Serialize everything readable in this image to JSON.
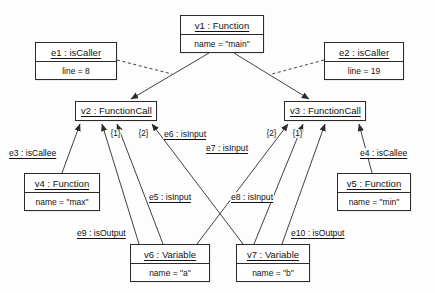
{
  "diagram": {
    "stroke_color": "#2b2b2b",
    "background_color": "#fdfdfd"
  },
  "nodes": [
    {
      "id": "v1",
      "title": "v1 : Function",
      "attr": "name = \"main\"",
      "x": 180,
      "y": 15,
      "w": 84,
      "h": 38
    },
    {
      "id": "e1",
      "title": "e1 : isCaller",
      "attr": "line = 8",
      "x": 35,
      "y": 42,
      "w": 82,
      "h": 38
    },
    {
      "id": "e2",
      "title": "e2 : isCaller",
      "attr": "line = 19",
      "x": 324,
      "y": 42,
      "w": 80,
      "h": 38
    },
    {
      "id": "v2",
      "title": "v2 : FunctionCall",
      "attr": "",
      "x": 75,
      "y": 101,
      "w": 82,
      "h": 20
    },
    {
      "id": "v3",
      "title": "v3 : FunctionCall",
      "attr": "",
      "x": 284,
      "y": 101,
      "w": 82,
      "h": 20
    },
    {
      "id": "v4",
      "title": "v4 : Function",
      "attr": "name = \"max\"",
      "x": 24,
      "y": 173,
      "w": 76,
      "h": 38
    },
    {
      "id": "v5",
      "title": "v5 : Function",
      "attr": "name = \"min\"",
      "x": 337,
      "y": 173,
      "w": 74,
      "h": 38
    },
    {
      "id": "v6",
      "title": "v6 : Variable",
      "attr": "name = \"a\"",
      "x": 130,
      "y": 244,
      "w": 80,
      "h": 38
    },
    {
      "id": "v7",
      "title": "v7 : Variable",
      "attr": "name = \"b\"",
      "x": 236,
      "y": 244,
      "w": 74,
      "h": 38
    }
  ],
  "edge_labels": [
    {
      "id": "e3",
      "text": "e3 : isCallee",
      "x": 8,
      "y": 148
    },
    {
      "id": "e4",
      "text": "e4 : isCallee",
      "x": 359,
      "y": 148
    },
    {
      "id": "e5",
      "text": "e5 : isInput",
      "x": 148,
      "y": 192
    },
    {
      "id": "e6",
      "text": "e6 : isInput",
      "x": 163,
      "y": 129
    },
    {
      "id": "e7",
      "text": "e7 : isInput",
      "x": 205,
      "y": 143
    },
    {
      "id": "e8",
      "text": "e8 : isInput",
      "x": 230,
      "y": 192
    },
    {
      "id": "e9",
      "text": "e9 : isOutput",
      "x": 76,
      "y": 228
    },
    {
      "id": "e10",
      "text": "e10 : isOutput",
      "x": 290,
      "y": 228
    }
  ],
  "multiplicities": [
    {
      "id": "m1",
      "text": "{1}",
      "x": 110,
      "y": 129
    },
    {
      "id": "m2",
      "text": "{2}",
      "x": 138,
      "y": 129
    },
    {
      "id": "m3",
      "text": "{2}",
      "x": 266,
      "y": 129
    },
    {
      "id": "m4",
      "text": "{1}",
      "x": 292,
      "y": 129
    }
  ],
  "connections": [
    {
      "id": "c1",
      "from": "v1",
      "to": "v2",
      "style": "solid",
      "arrow": true,
      "label": null
    },
    {
      "id": "c2",
      "from": "v1",
      "to": "v3",
      "style": "solid",
      "arrow": true,
      "label": null
    },
    {
      "id": "c3",
      "from": "e1",
      "to": "c1",
      "style": "dashed",
      "arrow": false,
      "label": null
    },
    {
      "id": "c4",
      "from": "e2",
      "to": "c2",
      "style": "dashed",
      "arrow": false,
      "label": null
    },
    {
      "id": "c5",
      "from": "v4",
      "to": "v2",
      "style": "solid",
      "arrow": true,
      "label": "e3"
    },
    {
      "id": "c6",
      "from": "v5",
      "to": "v3",
      "style": "solid",
      "arrow": true,
      "label": "e4"
    },
    {
      "id": "c7",
      "from": "v6",
      "to": "v2",
      "style": "solid",
      "arrow": true,
      "label": "e5"
    },
    {
      "id": "c8",
      "from": "v7",
      "to": "v2",
      "style": "solid",
      "arrow": true,
      "label": "e6"
    },
    {
      "id": "c9",
      "from": "v6",
      "to": "v3",
      "style": "solid",
      "arrow": true,
      "label": "e7"
    },
    {
      "id": "c10",
      "from": "v7",
      "to": "v3",
      "style": "solid",
      "arrow": true,
      "label": "e8"
    },
    {
      "id": "c11",
      "from": "v6",
      "to": "v2",
      "style": "solid",
      "arrow": true,
      "label": "e9"
    },
    {
      "id": "c12",
      "from": "v7",
      "to": "v3",
      "style": "solid",
      "arrow": true,
      "label": "e10"
    }
  ]
}
